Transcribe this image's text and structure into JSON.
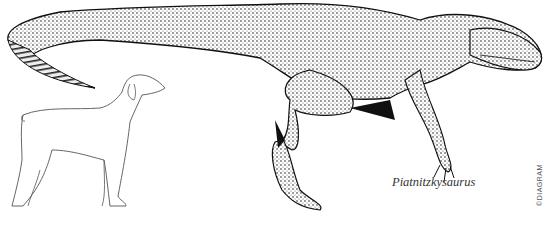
{
  "illustration": {
    "subject": "Piatnitzkysaurus size comparison with dog",
    "caption": "Piatnitzkysaurus",
    "copyright": "©DIAGRAM",
    "colors": {
      "ink": "#1a1a1a",
      "background": "#ffffff",
      "dog_outline": "#555555"
    }
  }
}
